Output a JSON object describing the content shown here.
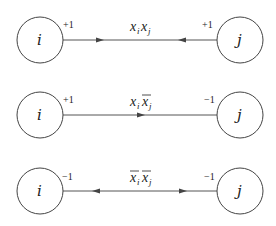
{
  "rows": [
    {
      "left_node": "i",
      "right_node": "j",
      "left_weight": "+1",
      "right_weight": "+1",
      "edge_label": {
        "var1": "x",
        "sub1": "i",
        "bar1": false,
        "var2": "x",
        "sub2": "j",
        "bar2": false
      },
      "arrows": [
        "right-pointing at left-center",
        "left-pointing at right-center"
      ]
    },
    {
      "left_node": "i",
      "right_node": "j",
      "left_weight": "+1",
      "right_weight": "−1",
      "edge_label": {
        "var1": "x",
        "sub1": "i",
        "bar1": false,
        "var2": "x",
        "sub2": "j",
        "bar2": true
      },
      "arrows": [
        "right-pointing at center"
      ]
    },
    {
      "left_node": "i",
      "right_node": "j",
      "left_weight": "−1",
      "right_weight": "−1",
      "edge_label": {
        "var1": "x",
        "sub1": "i",
        "bar1": true,
        "var2": "x",
        "sub2": "j",
        "bar2": true
      },
      "arrows": [
        "left-pointing at left-center",
        "right-pointing at right-center"
      ]
    }
  ]
}
